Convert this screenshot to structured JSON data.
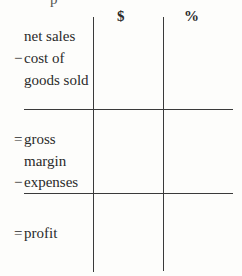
{
  "header_fragment": "p",
  "columns": {
    "dollar": "$",
    "percent": "%"
  },
  "rows": [
    {
      "operator": "",
      "label": "net sales"
    },
    {
      "operator": "−",
      "label": "cost of"
    },
    {
      "operator": "",
      "label": "goods sold"
    },
    {
      "operator": "=",
      "label": "gross"
    },
    {
      "operator": "",
      "label": "margin"
    },
    {
      "operator": "−",
      "label": "expenses"
    },
    {
      "operator": "=",
      "label": "profit"
    }
  ]
}
